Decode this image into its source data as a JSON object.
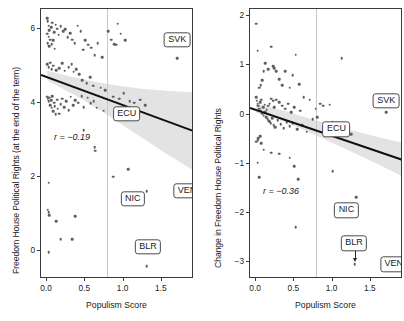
{
  "figure": {
    "type": "scatter-pair",
    "shared_xlabel": "Populism Score"
  },
  "chart_data": [
    {
      "type": "scatter",
      "panel": "left",
      "title": "",
      "xlabel": "Populism Score",
      "ylabel": "Freedom House Political Rights (at the end of the term)",
      "xlim": [
        -0.08,
        1.92
      ],
      "ylim": [
        -0.75,
        6.55
      ],
      "xticks": [
        0.0,
        0.5,
        1.0,
        1.5
      ],
      "xticklabels": [
        "0.0",
        "0.5",
        "1.0",
        "1.5"
      ],
      "yticks": [
        0,
        2,
        4,
        6
      ],
      "yticklabels": [
        "0",
        "2",
        "4",
        "6"
      ],
      "grid": false,
      "legend": "none",
      "annotations": [
        {
          "name": "r-value",
          "text": "r = −0.19",
          "x": 0.09,
          "y": 3.05
        },
        {
          "name": "SVK",
          "text": "SVK",
          "x": 1.7,
          "y": 5.72,
          "point": [
            1.7,
            5.22
          ]
        },
        {
          "name": "ECU",
          "text": "ECU",
          "x": 1.04,
          "y": 3.72,
          "point": [
            1.04,
            3.72
          ]
        },
        {
          "name": "NIC",
          "text": "NIC",
          "x": 1.12,
          "y": 1.42,
          "point": [
            1.3,
            1.62
          ]
        },
        {
          "name": "VEN",
          "text": "VEN",
          "x": 1.83,
          "y": 1.64,
          "point": [
            1.9,
            1.62
          ]
        },
        {
          "name": "BLR",
          "text": "BLR",
          "x": 1.32,
          "y": 0.12,
          "point": [
            1.3,
            -0.4
          ]
        }
      ],
      "reference_line": {
        "orientation": "vertical",
        "x": 0.78,
        "color": "#c8c8c8"
      },
      "trend_line": {
        "x": [
          -0.08,
          1.92
        ],
        "y": [
          4.8,
          3.28
        ],
        "color": "#111111"
      },
      "confidence_band": {
        "x": [
          0.0,
          0.4,
          0.78,
          1.2,
          1.6,
          1.92
        ],
        "upper": [
          4.88,
          4.68,
          4.52,
          4.4,
          4.33,
          4.3
        ],
        "lower": [
          4.62,
          4.18,
          3.7,
          3.12,
          2.58,
          2.18
        ],
        "color": "#d9d9d9"
      },
      "points": [
        [
          0.0,
          6.3
        ],
        [
          0.01,
          6.22
        ],
        [
          0.02,
          6.1
        ],
        [
          0.03,
          5.98
        ],
        [
          0.0,
          5.88
        ],
        [
          0.02,
          5.8
        ],
        [
          0.04,
          5.72
        ],
        [
          0.01,
          5.62
        ],
        [
          0.03,
          5.55
        ],
        [
          0.05,
          6.05
        ],
        [
          0.07,
          6.18
        ],
        [
          0.09,
          5.92
        ],
        [
          0.11,
          6.12
        ],
        [
          0.13,
          6.02
        ],
        [
          0.15,
          5.85
        ],
        [
          0.08,
          5.7
        ],
        [
          0.06,
          5.6
        ],
        [
          0.1,
          5.48
        ],
        [
          0.18,
          6.08
        ],
        [
          0.21,
          5.95
        ],
        [
          0.24,
          6.0
        ],
        [
          0.27,
          5.78
        ],
        [
          0.3,
          5.9
        ],
        [
          0.33,
          5.72
        ],
        [
          0.36,
          5.62
        ],
        [
          0.4,
          6.1
        ],
        [
          0.44,
          5.95
        ],
        [
          0.47,
          5.45
        ],
        [
          0.5,
          5.7
        ],
        [
          0.54,
          5.58
        ],
        [
          0.58,
          5.5
        ],
        [
          0.62,
          5.3
        ],
        [
          0.66,
          5.62
        ],
        [
          0.72,
          5.25
        ],
        [
          0.8,
          5.95
        ],
        [
          0.84,
          5.72
        ],
        [
          0.88,
          5.6
        ],
        [
          0.92,
          6.15
        ],
        [
          0.96,
          5.88
        ],
        [
          0.9,
          5.58
        ],
        [
          1.02,
          5.7
        ],
        [
          0.0,
          5.05
        ],
        [
          0.02,
          4.98
        ],
        [
          0.04,
          5.1
        ],
        [
          0.06,
          4.92
        ],
        [
          0.08,
          5.02
        ],
        [
          0.12,
          4.9
        ],
        [
          0.16,
          4.95
        ],
        [
          0.2,
          5.08
        ],
        [
          0.23,
          4.88
        ],
        [
          0.28,
          4.98
        ],
        [
          0.32,
          5.05
        ],
        [
          0.35,
          4.85
        ],
        [
          0.38,
          4.92
        ],
        [
          0.42,
          4.78
        ],
        [
          0.46,
          4.62
        ],
        [
          0.52,
          4.55
        ],
        [
          0.56,
          4.7
        ],
        [
          0.6,
          4.48
        ],
        [
          0.7,
          4.42
        ],
        [
          0.76,
          4.35
        ],
        [
          0.0,
          4.18
        ],
        [
          0.01,
          4.12
        ],
        [
          0.02,
          4.05
        ],
        [
          0.03,
          4.15
        ],
        [
          0.04,
          3.95
        ],
        [
          0.05,
          4.08
        ],
        [
          0.06,
          3.88
        ],
        [
          0.07,
          4.2
        ],
        [
          0.08,
          3.78
        ],
        [
          0.09,
          4.02
        ],
        [
          0.1,
          3.92
        ],
        [
          0.11,
          3.7
        ],
        [
          0.13,
          4.1
        ],
        [
          0.14,
          3.85
        ],
        [
          0.16,
          3.72
        ],
        [
          0.18,
          3.98
        ],
        [
          0.2,
          4.12
        ],
        [
          0.22,
          3.9
        ],
        [
          0.25,
          4.05
        ],
        [
          0.28,
          3.82
        ],
        [
          0.31,
          4.18
        ],
        [
          0.34,
          3.95
        ],
        [
          0.37,
          4.08
        ],
        [
          0.41,
          4.02
        ],
        [
          0.45,
          4.2
        ],
        [
          0.48,
          3.9
        ],
        [
          0.53,
          4.15
        ],
        [
          0.57,
          4.0
        ],
        [
          0.61,
          4.05
        ],
        [
          0.65,
          3.88
        ],
        [
          0.74,
          3.8
        ],
        [
          0.86,
          4.18
        ],
        [
          0.94,
          4.12
        ],
        [
          1.0,
          4.28
        ],
        [
          1.08,
          4.05
        ],
        [
          1.14,
          4.02
        ],
        [
          1.22,
          4.1
        ],
        [
          1.28,
          3.95
        ],
        [
          0.48,
          3.28
        ],
        [
          0.62,
          2.82
        ],
        [
          0.63,
          2.72
        ],
        [
          0.86,
          2.02
        ],
        [
          1.06,
          2.22
        ],
        [
          0.02,
          1.85
        ],
        [
          0.01,
          1.12
        ],
        [
          0.02,
          1.05
        ],
        [
          0.03,
          0.98
        ],
        [
          0.12,
          0.82
        ],
        [
          0.37,
          0.95
        ],
        [
          0.18,
          0.32
        ],
        [
          0.33,
          0.32
        ],
        [
          0.02,
          -0.02
        ],
        [
          1.3,
          1.62
        ],
        [
          1.9,
          1.62
        ],
        [
          1.7,
          5.22
        ],
        [
          1.3,
          -0.4
        ],
        [
          1.04,
          3.72
        ]
      ]
    },
    {
      "type": "scatter",
      "panel": "right",
      "title": "",
      "xlabel": "Populism Score",
      "ylabel": "Change in Freedom House Political Rights",
      "xlim": [
        -0.08,
        1.92
      ],
      "ylim": [
        -3.35,
        2.15
      ],
      "xticks": [
        0.0,
        0.5,
        1.0,
        1.5
      ],
      "xticklabels": [
        "0.0",
        "0.5",
        "1.0",
        "1.5"
      ],
      "yticks": [
        2,
        1,
        0,
        -1,
        -2,
        -3
      ],
      "yticklabels": [
        "2",
        "1",
        "0",
        "−1",
        "−2",
        "−3"
      ],
      "grid": false,
      "legend": "none",
      "annotations": [
        {
          "name": "r-value",
          "text": "r = −0.36",
          "x": 0.09,
          "y": -1.58
        },
        {
          "name": "SVK",
          "text": "SVK",
          "x": 1.7,
          "y": 0.28,
          "point": [
            1.7,
            0.05
          ]
        },
        {
          "name": "ECU",
          "text": "ECU",
          "x": 1.05,
          "y": -0.3,
          "point": [
            1.05,
            -0.3
          ]
        },
        {
          "name": "NIC",
          "text": "NIC",
          "x": 1.18,
          "y": -1.95,
          "point": [
            1.31,
            -1.68
          ]
        },
        {
          "name": "BLR",
          "text": "BLR",
          "x": 1.28,
          "y": -2.62,
          "point": [
            1.29,
            -3.05
          ],
          "arrow": true
        },
        {
          "name": "VEN",
          "text": "VEN",
          "x": 1.8,
          "y": -3.05,
          "point": [
            1.9,
            -3.05
          ]
        }
      ],
      "reference_line": {
        "orientation": "vertical",
        "x": 0.78,
        "color": "#c8c8c8"
      },
      "trend_line": {
        "x": [
          -0.08,
          1.92
        ],
        "y": [
          0.16,
          -0.9
        ],
        "color": "#111111"
      },
      "confidence_band": {
        "x": [
          0.0,
          0.4,
          0.78,
          1.2,
          1.6,
          1.92
        ],
        "upper": [
          0.22,
          0.06,
          -0.12,
          -0.3,
          -0.46,
          -0.58
        ],
        "lower": [
          0.04,
          -0.16,
          -0.42,
          -0.72,
          -1.02,
          -1.26
        ],
        "color": "#d9d9d9"
      },
      "points": [
        [
          0.0,
          1.85
        ],
        [
          0.02,
          1.3
        ],
        [
          0.2,
          1.38
        ],
        [
          0.12,
          1.05
        ],
        [
          0.1,
          0.88
        ],
        [
          0.16,
          0.92
        ],
        [
          0.22,
          0.98
        ],
        [
          0.24,
          0.95
        ],
        [
          0.26,
          0.88
        ],
        [
          0.3,
          0.72
        ],
        [
          0.34,
          0.6
        ],
        [
          0.38,
          0.88
        ],
        [
          0.44,
          0.55
        ],
        [
          0.52,
          1.22
        ],
        [
          0.48,
          0.8
        ],
        [
          0.56,
          0.62
        ],
        [
          0.08,
          0.7
        ],
        [
          0.06,
          0.6
        ],
        [
          0.04,
          0.55
        ],
        [
          1.12,
          1.15
        ],
        [
          0.0,
          0.35
        ],
        [
          0.01,
          0.28
        ],
        [
          0.02,
          0.22
        ],
        [
          0.03,
          0.18
        ],
        [
          0.04,
          0.12
        ],
        [
          0.05,
          0.25
        ],
        [
          0.06,
          0.08
        ],
        [
          0.07,
          0.3
        ],
        [
          0.08,
          0.02
        ],
        [
          0.09,
          0.15
        ],
        [
          0.1,
          -0.02
        ],
        [
          0.11,
          0.2
        ],
        [
          0.12,
          0.05
        ],
        [
          0.13,
          -0.06
        ],
        [
          0.14,
          0.1
        ],
        [
          0.15,
          -0.1
        ],
        [
          0.16,
          0.18
        ],
        [
          0.17,
          -0.14
        ],
        [
          0.18,
          0.22
        ],
        [
          0.19,
          -0.18
        ],
        [
          0.2,
          0.32
        ],
        [
          0.21,
          -0.08
        ],
        [
          0.22,
          0.28
        ],
        [
          0.23,
          -0.22
        ],
        [
          0.24,
          0.15
        ],
        [
          0.25,
          -0.26
        ],
        [
          0.26,
          0.3
        ],
        [
          0.28,
          -0.12
        ],
        [
          0.3,
          0.25
        ],
        [
          0.32,
          -0.2
        ],
        [
          0.34,
          0.18
        ],
        [
          0.36,
          -0.28
        ],
        [
          0.38,
          0.12
        ],
        [
          0.4,
          -0.15
        ],
        [
          0.42,
          0.22
        ],
        [
          0.44,
          -0.24
        ],
        [
          0.46,
          0.05
        ],
        [
          0.48,
          -0.18
        ],
        [
          0.5,
          0.15
        ],
        [
          0.54,
          -0.3
        ],
        [
          0.58,
          0.08
        ],
        [
          0.6,
          -0.22
        ],
        [
          0.62,
          0.35
        ],
        [
          0.66,
          -0.35
        ],
        [
          0.7,
          0.3
        ],
        [
          0.74,
          -0.1
        ],
        [
          0.78,
          0.12
        ],
        [
          0.8,
          -0.05
        ],
        [
          0.84,
          0.22
        ],
        [
          0.88,
          0.18
        ],
        [
          0.92,
          -0.25
        ],
        [
          0.96,
          0.2
        ],
        [
          1.0,
          -0.15
        ],
        [
          1.04,
          -0.3
        ],
        [
          1.1,
          -0.35
        ],
        [
          1.18,
          -0.28
        ],
        [
          1.24,
          -0.4
        ],
        [
          0.0,
          -0.55
        ],
        [
          0.02,
          -0.52
        ],
        [
          0.03,
          -0.48
        ],
        [
          0.05,
          -0.44
        ],
        [
          0.07,
          -0.58
        ],
        [
          0.1,
          -0.72
        ],
        [
          0.02,
          -0.98
        ],
        [
          0.04,
          -1.28
        ],
        [
          0.2,
          -0.78
        ],
        [
          0.3,
          -0.8
        ],
        [
          0.44,
          -0.88
        ],
        [
          0.5,
          -1.05
        ],
        [
          0.55,
          -1.32
        ],
        [
          0.52,
          -2.3
        ],
        [
          1.0,
          -1.15
        ],
        [
          1.31,
          -1.68
        ],
        [
          1.7,
          0.05
        ],
        [
          1.29,
          -3.05
        ],
        [
          1.9,
          -3.05
        ],
        [
          1.05,
          -0.3
        ]
      ]
    }
  ]
}
